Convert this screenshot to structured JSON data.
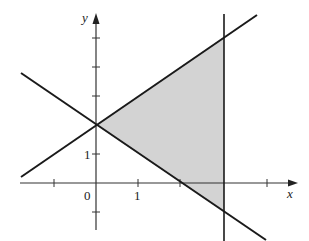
{
  "figure": {
    "type": "region-graph",
    "axes": {
      "x_label": "x",
      "y_label": "y",
      "origin_label": "0",
      "x_tick_label": "1",
      "y_tick_label": "1",
      "x_ticks": [
        -1,
        0,
        1,
        2,
        3,
        4
      ],
      "y_ticks": [
        -1,
        1,
        2,
        3,
        4,
        5
      ]
    },
    "lines": [
      {
        "name": "rising-line",
        "equation": "y = 2 + (2/3)x"
      },
      {
        "name": "falling-line",
        "equation": "y = 2 - x"
      },
      {
        "name": "vertical-line",
        "equation": "x = 3"
      }
    ],
    "shaded_region": {
      "vertices": [
        [
          0,
          2
        ],
        [
          3,
          4
        ],
        [
          3,
          -1
        ]
      ],
      "fill": "#d3d3d3"
    },
    "colors": {
      "line": "#1a1a1a",
      "axis": "#333333",
      "shade": "#d3d3d3"
    }
  }
}
